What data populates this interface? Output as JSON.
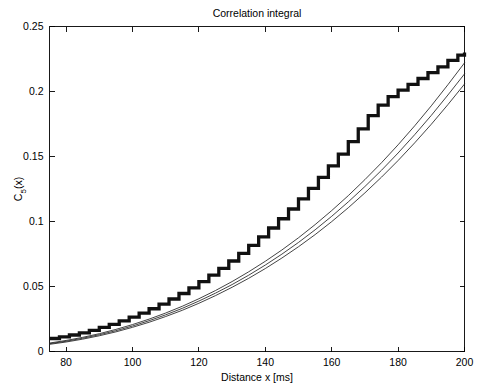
{
  "chart_data": {
    "type": "line",
    "title": "Correlation integral",
    "xlabel": "Distance x [ms]",
    "ylabel": "C_5(x)",
    "ylabel_base": "C",
    "ylabel_sub": "5",
    "ylabel_arg": "(x)",
    "xlim": [
      75,
      200
    ],
    "ylim": [
      0,
      0.25
    ],
    "xticks": [
      80,
      100,
      120,
      140,
      160,
      180,
      200
    ],
    "yticks": [
      0,
      0.05,
      0.1,
      0.15,
      0.2,
      0.25
    ],
    "xticklabels": [
      "80",
      "100",
      "120",
      "140",
      "160",
      "180",
      "200"
    ],
    "yticklabels": [
      "0",
      "0.05",
      "0.1",
      "0.15",
      "0.2",
      "0.25"
    ],
    "grid": false,
    "legend": "none",
    "box": true,
    "tick_direction": "in",
    "series": [
      {
        "name": "empirical correlation integral (staircase)",
        "style": "staircase",
        "linewidth": 3.3,
        "color": "#111111",
        "x": [
          75,
          78,
          81,
          84,
          87,
          90,
          93,
          96,
          99,
          102,
          105,
          108,
          111,
          114,
          117,
          120,
          123,
          126,
          129,
          132,
          135,
          138,
          141,
          144,
          147,
          150,
          153,
          156,
          159,
          162,
          165,
          168,
          171,
          174,
          177,
          180,
          183,
          186,
          189,
          192,
          195,
          198,
          200
        ],
        "values": [
          0.01,
          0.0112,
          0.0127,
          0.0144,
          0.0163,
          0.0185,
          0.0209,
          0.0235,
          0.0264,
          0.0295,
          0.0329,
          0.0365,
          0.0404,
          0.0446,
          0.049,
          0.0537,
          0.0587,
          0.064,
          0.0696,
          0.0755,
          0.0817,
          0.0882,
          0.095,
          0.1021,
          0.1096,
          0.1174,
          0.1255,
          0.134,
          0.1428,
          0.1519,
          0.1614,
          0.1712,
          0.1814,
          0.1895,
          0.196,
          0.201,
          0.2055,
          0.21,
          0.2145,
          0.219,
          0.224,
          0.228,
          0.23
        ]
      },
      {
        "name": "model fit upper",
        "style": "smooth",
        "linewidth": 0.85,
        "color": "#222222",
        "x": [
          75,
          80,
          85,
          90,
          95,
          100,
          105,
          110,
          115,
          120,
          125,
          130,
          135,
          140,
          145,
          150,
          155,
          160,
          165,
          170,
          175,
          180,
          185,
          190,
          195,
          200
        ],
        "values": [
          0.0065,
          0.0085,
          0.0109,
          0.0137,
          0.017,
          0.0207,
          0.0249,
          0.0296,
          0.0348,
          0.0406,
          0.0469,
          0.0538,
          0.0613,
          0.0694,
          0.0781,
          0.0875,
          0.0976,
          0.1084,
          0.1199,
          0.1322,
          0.1452,
          0.159,
          0.1736,
          0.189,
          0.2052,
          0.222
        ]
      },
      {
        "name": "model fit middle",
        "style": "smooth",
        "linewidth": 0.85,
        "color": "#222222",
        "x": [
          75,
          80,
          85,
          90,
          95,
          100,
          105,
          110,
          115,
          120,
          125,
          130,
          135,
          140,
          145,
          150,
          155,
          160,
          165,
          170,
          175,
          180,
          185,
          190,
          195,
          200
        ],
        "values": [
          0.006,
          0.0079,
          0.0102,
          0.0129,
          0.016,
          0.0196,
          0.0237,
          0.0282,
          0.0332,
          0.0388,
          0.0449,
          0.0515,
          0.0587,
          0.0665,
          0.0749,
          0.0839,
          0.0936,
          0.104,
          0.1151,
          0.1269,
          0.1394,
          0.1527,
          0.1668,
          0.1816,
          0.1973,
          0.2135
        ]
      },
      {
        "name": "model fit lower",
        "style": "smooth",
        "linewidth": 0.85,
        "color": "#222222",
        "x": [
          75,
          80,
          85,
          90,
          95,
          100,
          105,
          110,
          115,
          120,
          125,
          130,
          135,
          140,
          145,
          150,
          155,
          160,
          165,
          170,
          175,
          180,
          185,
          190,
          195,
          200
        ],
        "values": [
          0.0055,
          0.0073,
          0.0095,
          0.0121,
          0.0151,
          0.0186,
          0.0225,
          0.0269,
          0.0317,
          0.0371,
          0.043,
          0.0494,
          0.0563,
          0.0638,
          0.0719,
          0.0806,
          0.0899,
          0.0999,
          0.1106,
          0.122,
          0.1341,
          0.1469,
          0.1605,
          0.1748,
          0.1899,
          0.2057
        ]
      }
    ]
  }
}
